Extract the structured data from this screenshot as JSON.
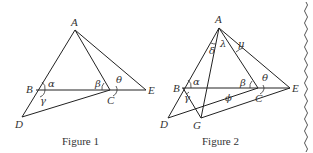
{
  "figures": [
    {
      "caption": "Figure 1",
      "points": {
        "A": "A",
        "B": "B",
        "C": "C",
        "D": "D",
        "E": "E"
      },
      "angles": {
        "alpha": "α",
        "beta": "β",
        "theta": "θ",
        "gamma": "γ"
      }
    },
    {
      "caption": "Figure 2",
      "points": {
        "A": "A",
        "B": "B",
        "C": "C",
        "D": "D",
        "E": "E",
        "G": "G"
      },
      "angles": {
        "alpha": "α",
        "beta": "β",
        "theta": "θ",
        "gamma": "γ",
        "delta": "δ",
        "lambda": "λ",
        "mu": "μ",
        "phi": "ϕ"
      }
    }
  ],
  "colors": {
    "line": "#222222",
    "text": "#333333",
    "background": "#ffffff"
  }
}
